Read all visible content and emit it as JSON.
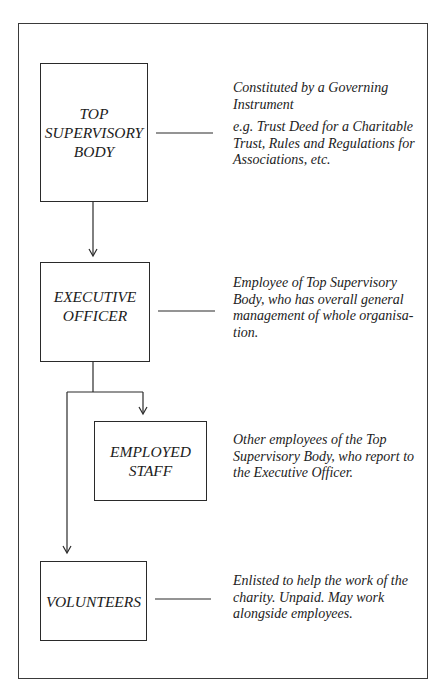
{
  "diagram": {
    "title": "",
    "nodes": [
      {
        "id": "top",
        "label": "TOP\nSUPERVISORY\nBODY"
      },
      {
        "id": "exec",
        "label": "EXECUTIVE\nOFFICER"
      },
      {
        "id": "staff",
        "label": "EMPLOYED\nSTAFF"
      },
      {
        "id": "vol",
        "label": "VOLUNTEERS"
      }
    ],
    "descriptions": [
      {
        "node": "top",
        "lines": [
          "Constituted by a Governing Instrument",
          "e.g. Trust Deed for a Charitable Trust, Rules and Regulations for Associations, etc."
        ]
      },
      {
        "node": "exec",
        "lines": [
          "Employee of Top Supervisory Body, who has overall general management of whole organisa-tion."
        ]
      },
      {
        "node": "staff",
        "lines": [
          "Other employees of the Top Supervisory Body, who report to the Executive Officer."
        ]
      },
      {
        "node": "vol",
        "lines": [
          "Enlisted to help the work of the charity. Unpaid. May work alongside employees."
        ]
      }
    ],
    "edges": [
      {
        "from": "top",
        "to": "exec",
        "type": "arrow"
      },
      {
        "from": "exec",
        "to": "staff",
        "type": "arrow"
      },
      {
        "from": "exec",
        "to": "vol",
        "type": "arrow"
      }
    ],
    "colors": {
      "line": "#2a2a2a",
      "background": "#ffffff",
      "text": "#1c1c1c"
    }
  }
}
